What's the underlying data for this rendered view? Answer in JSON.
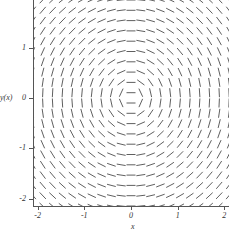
{
  "chart_data": {
    "type": "quiver",
    "title": "",
    "subtitle": "",
    "xlabel": "x",
    "ylabel": "y(x)",
    "xlim": [
      -2.1,
      2.1
    ],
    "ylim": [
      -2.15,
      1.95
    ],
    "grid": false,
    "legend": null,
    "xticks": [
      -2,
      -1,
      0,
      1,
      2
    ],
    "xticklabels": [
      "-2",
      "-1",
      "0",
      "1",
      "2"
    ],
    "yticks": [
      1,
      0,
      -1,
      -2
    ],
    "yticklabels": [
      "1",
      "0",
      "-1",
      "-2"
    ],
    "segment_color": "#4d4d4d",
    "axis_color": "#555555",
    "background": "#ffffff",
    "field": {
      "nx": 21,
      "ny": 21,
      "x_start": -2.1,
      "x_end": 2.1,
      "y_start": -2.15,
      "y_end": 1.95,
      "slope_formula": "dy/dx = -x / y",
      "singular_line_y": 0,
      "segment_length_px": 9
    }
  },
  "axes": {
    "y_title": "y(x)",
    "x_title": "x",
    "y_ticks": [
      {
        "label": "1",
        "value": 1
      },
      {
        "label": "0",
        "value": 0
      },
      {
        "label": "-1",
        "value": -1
      },
      {
        "label": "-2",
        "value": -2
      }
    ],
    "x_ticks": [
      {
        "label": "-2",
        "value": -2
      },
      {
        "label": "-1",
        "value": -1
      },
      {
        "label": "0",
        "value": 0
      },
      {
        "label": "1",
        "value": 1
      },
      {
        "label": "2",
        "value": 2
      }
    ]
  }
}
